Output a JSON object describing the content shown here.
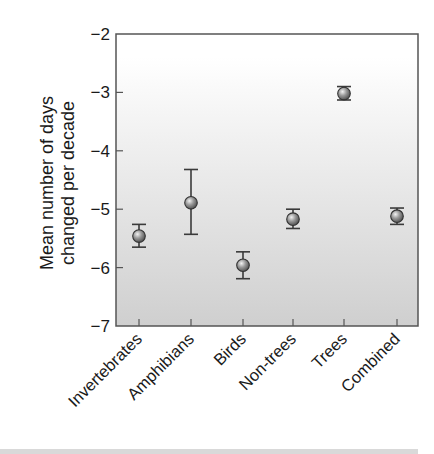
{
  "chart_data": {
    "type": "scatter",
    "subtype": "point-with-error-bars",
    "title": "",
    "xlabel": "",
    "ylabel": "Mean number of days changed per decade",
    "ylabel_lines": [
      "Mean number of days",
      "changed per decade"
    ],
    "ylim": [
      -7,
      -2
    ],
    "yticks": [
      -2,
      -3,
      -4,
      -5,
      -6,
      -7
    ],
    "ytick_labels": [
      "−2",
      "−3",
      "−4",
      "−5",
      "−6",
      "−7"
    ],
    "grid": false,
    "legend": null,
    "categories": [
      "Invertebrates",
      "Amphibians",
      "Birds",
      "Non-trees",
      "Trees",
      "Combined"
    ],
    "values": [
      -5.46,
      -4.89,
      -5.96,
      -5.17,
      -3.02,
      -5.12
    ],
    "error_low": [
      -5.65,
      -5.43,
      -6.19,
      -5.33,
      -3.13,
      -5.26
    ],
    "error_high": [
      -5.26,
      -4.32,
      -5.73,
      -5.0,
      -2.9,
      -4.98
    ],
    "colors": {
      "marker": "#8c8c8c",
      "marker_edge": "#333333",
      "axis": "#555555",
      "plot_bg_top": "#ffffff",
      "plot_bg_bottom": "#cfcfcf"
    }
  }
}
